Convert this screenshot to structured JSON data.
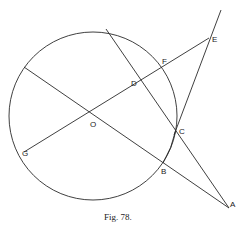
{
  "caption": "Fig. 78.",
  "colors": {
    "stroke": "#2a2a2a",
    "background": "#ffffff"
  },
  "points": {
    "O": {
      "label": "O",
      "x": 93,
      "y": 116
    },
    "A": {
      "label": "A",
      "x": 229,
      "y": 208
    },
    "B": {
      "label": "B",
      "x": 163,
      "y": 163
    },
    "C": {
      "label": "C",
      "x": 176,
      "y": 130
    },
    "D": {
      "label": "D",
      "x": 142,
      "y": 83
    },
    "E": {
      "label": "E",
      "x": 209,
      "y": 38
    },
    "F": {
      "label": "F",
      "x": 164,
      "y": 69
    },
    "G": {
      "label": "G",
      "x": 24,
      "y": 152
    }
  },
  "circle": {
    "cx": 93,
    "cy": 116,
    "r": 84
  },
  "segments": [
    {
      "name": "chord-through-D-C-to-A",
      "from": [
        106,
        29
      ],
      "to": [
        229,
        208
      ]
    },
    {
      "name": "line-through-O-B-to-A",
      "from": [
        24,
        67
      ],
      "to": [
        229,
        208
      ]
    },
    {
      "name": "diameter-G-O-F-to-E",
      "from": [
        24,
        152
      ],
      "to": [
        209,
        38
      ]
    },
    {
      "name": "tangent-line-A-C-E-extended",
      "from": [
        174,
        135
      ],
      "to": [
        221,
        10
      ]
    }
  ]
}
